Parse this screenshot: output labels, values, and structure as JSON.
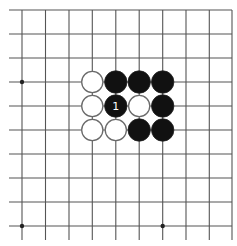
{
  "board": {
    "description": "Go board diagram (partial view, top-right edge visible)",
    "grid": {
      "columns_x": [
        22,
        45.5,
        69,
        92.3,
        115.8,
        139.2,
        162.7,
        186,
        209.3,
        232
      ],
      "rows_y": [
        10,
        34,
        58,
        82,
        106,
        130,
        154,
        178,
        202,
        226
      ],
      "h_line_start_x": 9,
      "v_line_end_y": 240,
      "line_color": "#555555"
    },
    "star_points": [
      {
        "col": 0,
        "row": 3
      },
      {
        "col": 0,
        "row": 9
      },
      {
        "col": 6,
        "row": 9
      }
    ],
    "stones": [
      {
        "col": 3,
        "row": 3,
        "color": "white"
      },
      {
        "col": 4,
        "row": 3,
        "color": "black"
      },
      {
        "col": 5,
        "row": 3,
        "color": "black"
      },
      {
        "col": 6,
        "row": 3,
        "color": "black"
      },
      {
        "col": 3,
        "row": 4,
        "color": "white"
      },
      {
        "col": 4,
        "row": 4,
        "color": "black",
        "label": "1"
      },
      {
        "col": 5,
        "row": 4,
        "color": "white"
      },
      {
        "col": 6,
        "row": 4,
        "color": "black"
      },
      {
        "col": 3,
        "row": 5,
        "color": "white"
      },
      {
        "col": 4,
        "row": 5,
        "color": "white"
      },
      {
        "col": 5,
        "row": 5,
        "color": "black"
      },
      {
        "col": 6,
        "row": 5,
        "color": "black"
      }
    ],
    "colors": {
      "black_stone": "#111111",
      "white_stone_fill": "#ffffff",
      "white_stone_stroke": "#6a6a6a",
      "label_on_black": "#ffffff"
    },
    "stone_radius": 11.2
  }
}
